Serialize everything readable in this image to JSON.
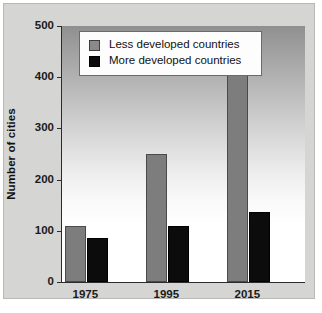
{
  "chart_data": {
    "type": "bar",
    "title": "",
    "xlabel": "",
    "ylabel": "Number of cities",
    "categories": [
      "1975",
      "1995",
      "2015"
    ],
    "series": [
      {
        "name": "Less developed countries",
        "color": "#7d7d7d",
        "values": [
          110,
          250,
          427
        ]
      },
      {
        "name": "More developed countries",
        "color": "#0c0c0c",
        "values": [
          85,
          110,
          136
        ]
      }
    ],
    "ylim": [
      0,
      500
    ],
    "yticks": [
      0,
      100,
      200,
      300,
      400,
      500
    ],
    "ytick_labels": [
      "0",
      "100",
      "200",
      "300",
      "400",
      "500"
    ],
    "grid": false,
    "legend_position": "top-center"
  },
  "legend": {
    "items": [
      {
        "label": "Less developed countries",
        "swatch": "gray"
      },
      {
        "label": "More developed countries",
        "swatch": "black"
      }
    ]
  },
  "axis": {
    "y_title": "Number of cities"
  }
}
